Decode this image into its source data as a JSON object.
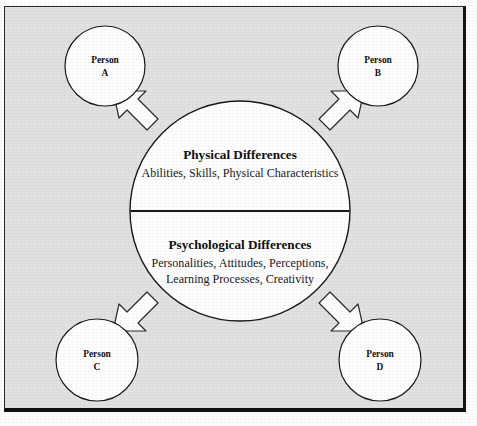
{
  "figure": {
    "name": "individual-differences-diagram",
    "panel": {
      "background_color": "#e2e2e2",
      "border_color": "#151515"
    },
    "center": {
      "shape": "circle",
      "fill_color": "#ffffff",
      "stroke_color": "#1a1a1a",
      "divider": "horizontal-line",
      "top_half": {
        "title": "Physical Differences",
        "detail_lines": [
          "Abilities, Skills, Physical Characteristics"
        ]
      },
      "bottom_half": {
        "title": "Psychological Differences",
        "detail_lines": [
          "Personalities, Attitudes, Perceptions,",
          "Learning Processes, Creativity"
        ]
      }
    },
    "people": [
      {
        "id": "person-a",
        "line1": "Person",
        "line2": "A",
        "position": "top-left"
      },
      {
        "id": "person-b",
        "line1": "Person",
        "line2": "B",
        "position": "top-right"
      },
      {
        "id": "person-c",
        "line1": "Person",
        "line2": "C",
        "position": "bottom-left"
      },
      {
        "id": "person-d",
        "line1": "Person",
        "line2": "D",
        "position": "bottom-right"
      }
    ],
    "arrows": [
      {
        "id": "arrow-to-person-a",
        "direction": "up-left",
        "style": "block-arrow"
      },
      {
        "id": "arrow-to-person-b",
        "direction": "up-right",
        "style": "block-arrow"
      },
      {
        "id": "arrow-to-person-c",
        "direction": "down-left",
        "style": "block-arrow"
      },
      {
        "id": "arrow-to-person-d",
        "direction": "down-right",
        "style": "block-arrow"
      }
    ]
  }
}
